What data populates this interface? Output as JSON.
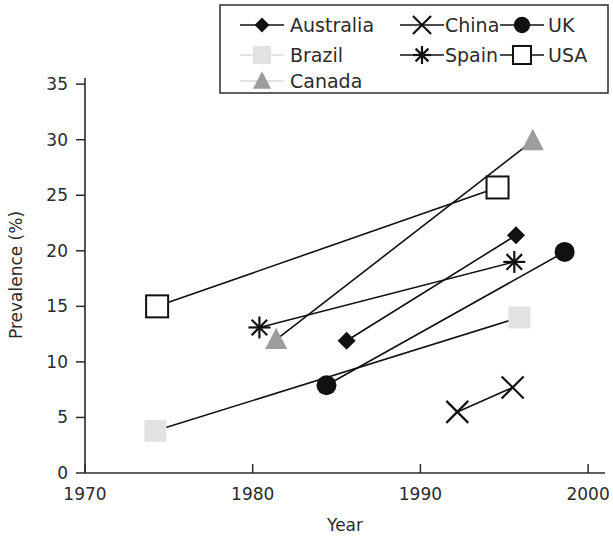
{
  "chart_data": {
    "type": "scatter",
    "title": "",
    "xlabel": "Year",
    "ylabel": "Prevalence (%)",
    "xlim": [
      1968,
      2001
    ],
    "ylim": [
      0,
      36
    ],
    "xticks": [
      1970,
      1980,
      1990,
      2000
    ],
    "yticks": [
      0,
      5,
      10,
      15,
      20,
      25,
      30,
      35
    ],
    "grid": false,
    "legend_position": "top",
    "series": [
      {
        "name": "Australia",
        "marker": "filled-diamond",
        "color": "#111111",
        "points": [
          [
            1985.6,
            11.9
          ],
          [
            1995.7,
            21.4
          ]
        ]
      },
      {
        "name": "Brazil",
        "marker": "light-square",
        "color": "#e2e2e2",
        "points": [
          [
            1974.2,
            3.8
          ],
          [
            1995.9,
            14.0
          ]
        ]
      },
      {
        "name": "Canada",
        "marker": "gray-triangle",
        "color": "#9d9d9d",
        "points": [
          [
            1981.4,
            12.0
          ],
          [
            1996.7,
            29.9
          ]
        ]
      },
      {
        "name": "China",
        "marker": "x-cross",
        "color": "#111111",
        "points": [
          [
            1992.2,
            5.5
          ],
          [
            1995.5,
            7.7
          ]
        ]
      },
      {
        "name": "Spain",
        "marker": "asterisk",
        "color": "#111111",
        "points": [
          [
            1980.4,
            13.1
          ],
          [
            1995.6,
            19.0
          ]
        ]
      },
      {
        "name": "UK",
        "marker": "filled-circle",
        "color": "#111111",
        "points": [
          [
            1984.4,
            7.9
          ],
          [
            1998.6,
            19.9
          ]
        ]
      },
      {
        "name": "USA",
        "marker": "open-square",
        "color": "#111111",
        "points": [
          [
            1974.3,
            15.0
          ],
          [
            1994.6,
            25.7
          ]
        ]
      }
    ]
  },
  "axes": {
    "x_title": "Year",
    "y_title": "Prevalence (%)",
    "x_tick_labels": [
      "1970",
      "1980",
      "1990",
      "2000"
    ],
    "y_tick_labels": [
      "0",
      "5",
      "10",
      "15",
      "20",
      "25",
      "30",
      "35"
    ]
  },
  "legend": {
    "entries": [
      {
        "label": "Australia",
        "marker": "filled-diamond"
      },
      {
        "label": "China",
        "marker": "x-cross"
      },
      {
        "label": "UK",
        "marker": "filled-circle"
      },
      {
        "label": "Brazil",
        "marker": "light-square"
      },
      {
        "label": "Spain",
        "marker": "asterisk"
      },
      {
        "label": "USA",
        "marker": "open-square"
      },
      {
        "label": "Canada",
        "marker": "gray-triangle"
      }
    ]
  },
  "colors": {
    "ink": "#111111",
    "axis": "#2b2b2b",
    "canada": "#9d9d9d",
    "brazil": "#e2e2e2",
    "background": "#ffffff"
  }
}
